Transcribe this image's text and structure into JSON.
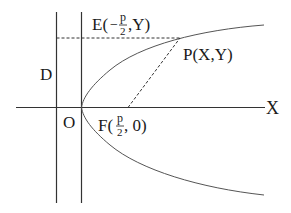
{
  "diagram": {
    "labels": {
      "directrix": "D",
      "origin": "O",
      "x_axis": "X",
      "point_p": "P(X,Y)",
      "point_e_prefix": "E(",
      "point_e_sign": "−",
      "point_e_num": "p",
      "point_e_den": "2",
      "point_e_suffix": ",Y)",
      "point_f_prefix": "F(",
      "point_f_num": "p",
      "point_f_den": "2",
      "point_f_suffix": ", 0)"
    },
    "colors": {
      "line": "#333333",
      "curve": "#555555",
      "dashed": "#333333",
      "text": "#1a1a1a"
    }
  }
}
